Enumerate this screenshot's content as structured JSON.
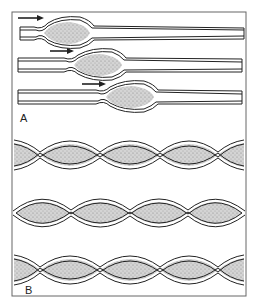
{
  "figure": {
    "panel_a": {
      "label": "A",
      "description": "Peristalsis: a bolus propelled along a tube by a wave of contraction behind it",
      "rows": [
        {
          "arrow_x1": 18,
          "arrow_x2": 42,
          "center_y": 33,
          "bolus_x": 62
        },
        {
          "arrow_x1": 50,
          "arrow_x2": 72,
          "center_y": 65,
          "bolus_x": 93
        },
        {
          "arrow_x1": 82,
          "arrow_x2": 104,
          "center_y": 97,
          "bolus_x": 125
        }
      ]
    },
    "panel_b": {
      "label": "B",
      "description": "Segmentation: alternating ring-like constrictions dividing contents into segments",
      "rows": [
        {
          "center_y": 155,
          "constrictions": [
            40,
            100,
            160,
            218
          ],
          "ends": "open"
        },
        {
          "center_y": 213,
          "constrictions": [
            71,
            130,
            188
          ],
          "ends": "closed"
        },
        {
          "center_y": 270,
          "constrictions": [
            40,
            100,
            160,
            218
          ],
          "ends": "open"
        }
      ]
    },
    "colors": {
      "line": "#2a2a2a",
      "fill": "#bdbdbd",
      "frame": "#555555",
      "background": "#ffffff"
    }
  }
}
